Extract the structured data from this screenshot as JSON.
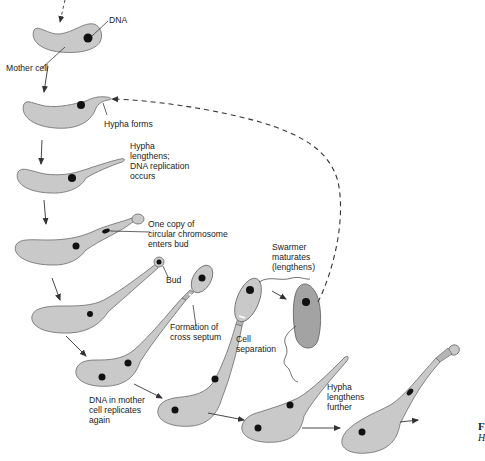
{
  "diagram": {
    "labels": {
      "dna": "DNA",
      "mother_cell": "Mother cell",
      "hypha_forms": "Hypha forms",
      "hypha_lengthens": "Hypha\nlengthens;\nDNA replication\noccurs",
      "one_copy": "One copy of\ncircular chromosome\nenters bud",
      "bud": "Bud",
      "swarmer": "Swarmer\nmaturates\n(lengthens)",
      "cross_septum": "Formation of\ncross septum",
      "cell_separation": "Cell\nseparation",
      "dna_replicates_again": "DNA in mother\ncell replicates\nagain",
      "hypha_further": "Hypha\nlengthens\nfurther"
    },
    "caption_fragment": {
      "line1": "F",
      "line2": "H"
    },
    "colors": {
      "cell_fill": "#c9c9c9",
      "swarmer_fill": "#a3a3a3",
      "outline": "#6a6a6a",
      "dna": "#111111"
    }
  }
}
